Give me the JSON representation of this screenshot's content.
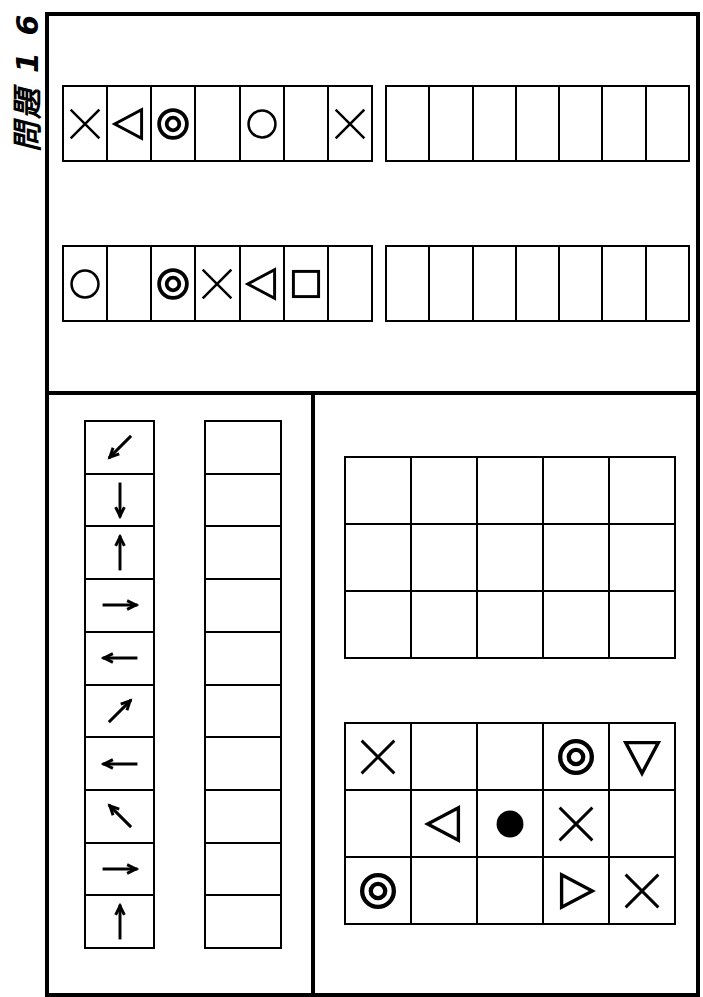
{
  "title": "問題 1 6",
  "top_panel": {
    "rows": [
      {
        "name": "sequence-row-1",
        "symbols": [
          "cross",
          "triangle-left",
          "double-circle",
          "empty",
          "circle",
          "empty",
          "cross"
        ],
        "answer_cells": 7
      },
      {
        "name": "sequence-row-2",
        "symbols": [
          "circle",
          "empty",
          "double-circle",
          "cross",
          "triangle-left",
          "square",
          "empty"
        ],
        "answer_cells": 7
      }
    ]
  },
  "bottom_left_panel": {
    "arrows": [
      "arrow-down-left",
      "arrow-down",
      "arrow-up",
      "arrow-right",
      "arrow-left",
      "arrow-up-right",
      "arrow-left",
      "arrow-up-left",
      "arrow-right",
      "arrow-up"
    ],
    "answer_cells": 10
  },
  "bottom_right_panel": {
    "answer_grid": {
      "columns": 5,
      "rows": 3
    },
    "symbol_grid": {
      "columns": 5,
      "rows": 3,
      "cells": [
        [
          "cross",
          "empty",
          "empty",
          "double-circle",
          "triangle-down"
        ],
        [
          "empty",
          "triangle-left",
          "filled-circle",
          "cross",
          "empty"
        ],
        [
          "double-circle",
          "empty",
          "empty",
          "triangle-right",
          "cross"
        ]
      ]
    }
  },
  "colors": {
    "ink": "#000000",
    "paper": "#ffffff"
  }
}
